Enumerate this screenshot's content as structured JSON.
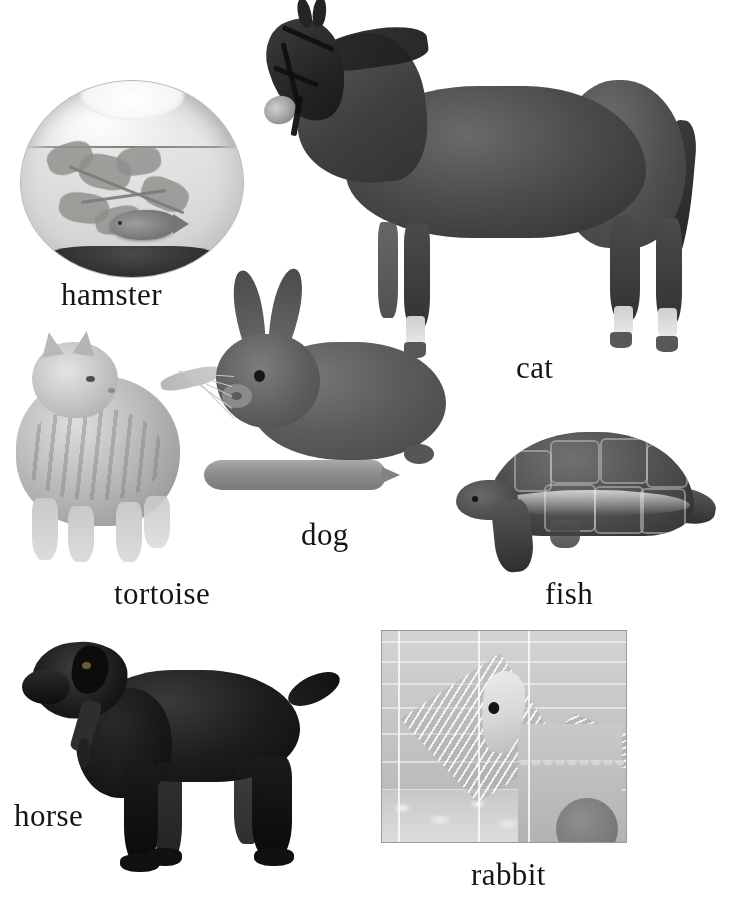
{
  "figure": {
    "background_color": "#ffffff",
    "label_color": "#141414",
    "width": 729,
    "height": 904
  },
  "items": [
    {
      "id": "fishbowl",
      "photo_subject": "goldfish in a round glass fishbowl with aquatic plant and dark gravel",
      "label": "hamster",
      "label_x": 61,
      "label_y": 279,
      "image_x": 20,
      "image_y": 72,
      "image_w": 222,
      "image_h": 205
    },
    {
      "id": "horse",
      "photo_subject": "dark bay horse standing in profile wearing a bridle, white socks",
      "label": "cat",
      "label_x": 516,
      "label_y": 352,
      "image_x": 258,
      "image_y": 0,
      "image_w": 435,
      "image_h": 378
    },
    {
      "id": "cat",
      "photo_subject": "grey tabby cat standing, looking up and to the right",
      "label": "tortoise",
      "label_x": 114,
      "label_y": 578,
      "image_x": 10,
      "image_y": 330,
      "image_w": 200,
      "image_h": 240
    },
    {
      "id": "rabbit",
      "photo_subject": "grey rabbit lying down beside a large carrot",
      "label": "dog",
      "label_x": 301,
      "label_y": 519,
      "image_x": 198,
      "image_y": 268,
      "image_w": 252,
      "image_h": 240
    },
    {
      "id": "tortoise",
      "photo_subject": "tortoise walking, domed patterned shell, side view",
      "label": "fish",
      "label_x": 545,
      "label_y": 578,
      "image_x": 452,
      "image_y": 428,
      "image_w": 270,
      "image_h": 160
    },
    {
      "id": "dog",
      "photo_subject": "black labrador retriever standing in profile with collar and tag",
      "label": "horse",
      "label_x": 14,
      "label_y": 800,
      "image_x": 20,
      "image_y": 630,
      "image_w": 330,
      "image_h": 250
    },
    {
      "id": "hamster-cage",
      "photo_subject": "white hamster on a wire ramp inside a cage with bedding and a plastic hut",
      "label": "rabbit",
      "label_x": 471,
      "label_y": 859,
      "image_x": 381,
      "image_y": 630,
      "image_w": 244,
      "image_h": 211
    }
  ],
  "labels": {
    "hamster": "hamster",
    "cat": "cat",
    "tortoise": "tortoise",
    "dog": "dog",
    "fish": "fish",
    "horse": "horse",
    "rabbit": "rabbit"
  }
}
